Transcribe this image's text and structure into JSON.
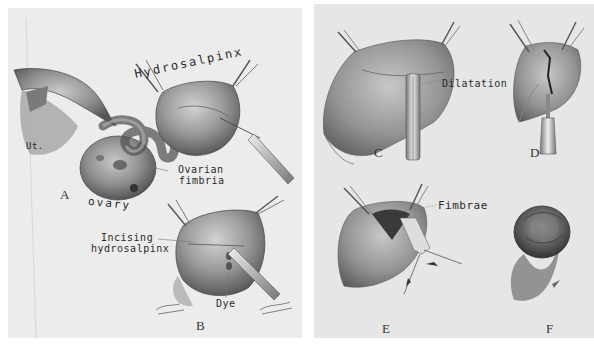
{
  "plate": {
    "left_panel": {
      "figures": [
        {
          "id": "A",
          "label": "A"
        },
        {
          "id": "B",
          "label": "B"
        }
      ],
      "annotations": {
        "uterus": "Ut.",
        "hydrosalpinx": "Hydrosalpinx",
        "ovarian_fimbria_line1": "Ovarian",
        "ovarian_fimbria_line2": "fimbria",
        "ovary": "ovary",
        "incising_line1": "Incising",
        "incising_line2": "hydrosalpinx",
        "dye": "Dye"
      }
    },
    "right_panel": {
      "figures": [
        {
          "id": "C",
          "label": "C"
        },
        {
          "id": "D",
          "label": "D"
        },
        {
          "id": "E",
          "label": "E"
        },
        {
          "id": "F",
          "label": "F"
        }
      ],
      "annotations": {
        "dilatation": "Dilatation",
        "fimbrae": "Fimbrae"
      }
    },
    "colors": {
      "panel_bg": "#ececec",
      "ink": "#2a2a2a",
      "tissue_dark": "#6a6a6a",
      "tissue_light": "#bdbdbd"
    }
  }
}
